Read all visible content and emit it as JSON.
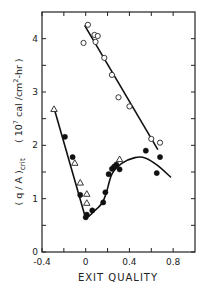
{
  "chart_data": {
    "type": "scatter",
    "title": "",
    "xlabel": "EXIT QUALITY",
    "ylabel": "( q / A )crit   ( 10⁷ cal / cm²-hr )",
    "ylabel_parts": {
      "main": "( q / A )",
      "main_sub": "crit",
      "units_open": "( 10",
      "units_exp": "7",
      "units_mid": " cal /cm",
      "units_exp2": "2",
      "units_close": "-hr )"
    },
    "xlim": [
      -0.4,
      1.0
    ],
    "ylim": [
      0,
      4.5
    ],
    "x_ticks": [
      -0.4,
      -0.2,
      0,
      0.2,
      0.4,
      0.6,
      0.8
    ],
    "x_tick_labels": [
      "-0.4",
      "0",
      "0.4",
      "0.8"
    ],
    "x_tick_label_values": [
      -0.4,
      0,
      0.4,
      0.8
    ],
    "y_ticks": [
      0,
      0.5,
      1,
      1.5,
      2,
      2.5,
      3,
      3.5,
      4
    ],
    "y_tick_labels": [
      "0",
      "1",
      "2",
      "3",
      "4"
    ],
    "y_tick_label_values": [
      0,
      1,
      2,
      3,
      4
    ],
    "grid": false,
    "legend": null,
    "series": [
      {
        "name": "open circles",
        "marker": "open-circle",
        "points": [
          {
            "x": 0.02,
            "y": 4.26
          },
          {
            "x": -0.02,
            "y": 3.92
          },
          {
            "x": 0.08,
            "y": 4.07
          },
          {
            "x": 0.11,
            "y": 4.05
          },
          {
            "x": 0.09,
            "y": 3.94
          },
          {
            "x": 0.17,
            "y": 3.64
          },
          {
            "x": 0.24,
            "y": 3.32
          },
          {
            "x": 0.3,
            "y": 2.9
          },
          {
            "x": 0.4,
            "y": 2.73
          },
          {
            "x": 0.6,
            "y": 2.12
          },
          {
            "x": 0.68,
            "y": 2.05
          }
        ]
      },
      {
        "name": "open triangles",
        "marker": "open-triangle",
        "points": [
          {
            "x": -0.29,
            "y": 2.68
          },
          {
            "x": -0.1,
            "y": 1.67
          },
          {
            "x": -0.05,
            "y": 1.3
          },
          {
            "x": 0.01,
            "y": 1.09
          },
          {
            "x": 0.01,
            "y": 0.92
          },
          {
            "x": 0.31,
            "y": 1.74
          }
        ]
      },
      {
        "name": "filled circles",
        "marker": "filled-circle",
        "points": [
          {
            "x": -0.19,
            "y": 2.16
          },
          {
            "x": -0.12,
            "y": 1.78
          },
          {
            "x": -0.05,
            "y": 1.07
          },
          {
            "x": 0.0,
            "y": 0.65
          },
          {
            "x": 0.01,
            "y": 0.7
          },
          {
            "x": 0.06,
            "y": 0.78
          },
          {
            "x": 0.16,
            "y": 0.93
          },
          {
            "x": 0.18,
            "y": 1.12
          },
          {
            "x": 0.21,
            "y": 1.46
          },
          {
            "x": 0.24,
            "y": 1.56
          },
          {
            "x": 0.26,
            "y": 1.6
          },
          {
            "x": 0.28,
            "y": 1.64
          },
          {
            "x": 0.31,
            "y": 1.55
          },
          {
            "x": 0.55,
            "y": 1.9
          },
          {
            "x": 0.65,
            "y": 1.48
          },
          {
            "x": 0.68,
            "y": 1.78
          }
        ]
      }
    ],
    "fit_lines": [
      {
        "name": "upper line (open circles)",
        "type": "line",
        "points": [
          {
            "x": -0.01,
            "y": 4.25
          },
          {
            "x": 0.66,
            "y": 1.92
          }
        ]
      },
      {
        "name": "left descending line",
        "type": "line",
        "points": [
          {
            "x": -0.29,
            "y": 2.7
          },
          {
            "x": -0.01,
            "y": 0.7
          }
        ]
      },
      {
        "name": "right rising curve",
        "type": "curve",
        "points": [
          {
            "x": -0.01,
            "y": 0.7
          },
          {
            "x": 0.02,
            "y": 0.66
          },
          {
            "x": 0.07,
            "y": 0.75
          },
          {
            "x": 0.15,
            "y": 0.92
          },
          {
            "x": 0.19,
            "y": 1.12
          },
          {
            "x": 0.24,
            "y": 1.46
          },
          {
            "x": 0.33,
            "y": 1.66
          },
          {
            "x": 0.45,
            "y": 1.77
          },
          {
            "x": 0.55,
            "y": 1.76
          },
          {
            "x": 0.66,
            "y": 1.62
          },
          {
            "x": 0.78,
            "y": 1.4
          }
        ]
      }
    ]
  }
}
